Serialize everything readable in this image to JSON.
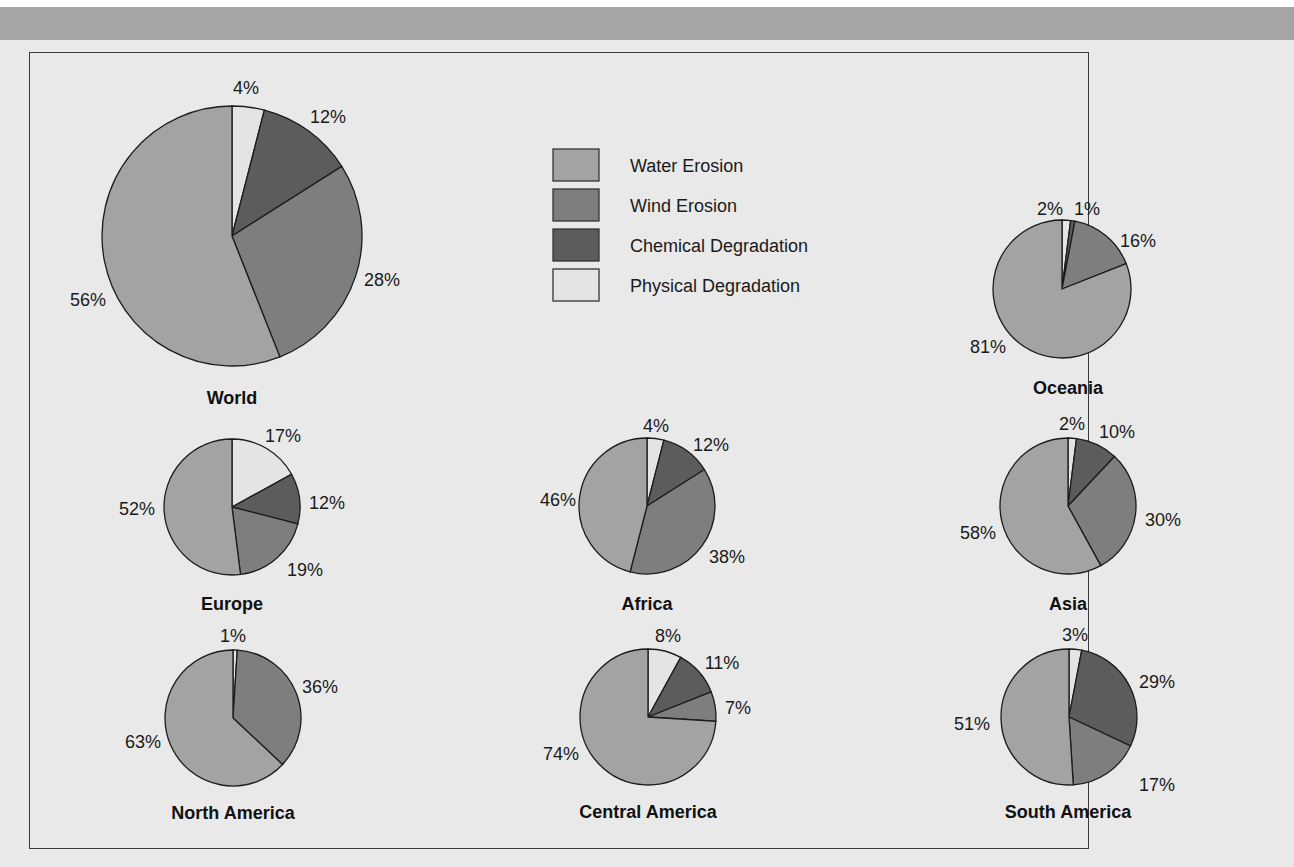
{
  "chart_data": {
    "type": "pie",
    "title": "",
    "legend": {
      "position": "top-center",
      "entries": [
        {
          "label": "Water Erosion",
          "color": "#a3a3a3"
        },
        {
          "label": "Wind Erosion",
          "color": "#7e7e7e"
        },
        {
          "label": "Chemical Degradation",
          "color": "#5c5c5c"
        },
        {
          "label": "Physical Degradation",
          "color": "#e4e4e4"
        }
      ]
    },
    "categories": [
      "Water Erosion",
      "Wind Erosion",
      "Chemical Degradation",
      "Physical Degradation"
    ],
    "charts": [
      {
        "name": "World",
        "values": {
          "Water Erosion": 56,
          "Wind Erosion": 28,
          "Chemical Degradation": 12,
          "Physical Degradation": 4
        }
      },
      {
        "name": "Oceania",
        "values": {
          "Water Erosion": 81,
          "Wind Erosion": 16,
          "Chemical Degradation": 1,
          "Physical Degradation": 2
        }
      },
      {
        "name": "Europe",
        "values": {
          "Water Erosion": 52,
          "Wind Erosion": 19,
          "Chemical Degradation": 12,
          "Physical Degradation": 17
        }
      },
      {
        "name": "Africa",
        "values": {
          "Water Erosion": 46,
          "Wind Erosion": 38,
          "Chemical Degradation": 12,
          "Physical Degradation": 4
        }
      },
      {
        "name": "Asia",
        "values": {
          "Water Erosion": 58,
          "Wind Erosion": 30,
          "Chemical Degradation": 10,
          "Physical Degradation": 2
        }
      },
      {
        "name": "North America",
        "values": {
          "Water Erosion": 63,
          "Wind Erosion": 36,
          "Chemical Degradation": 0,
          "Physical Degradation": 1
        }
      },
      {
        "name": "Central America",
        "values": {
          "Water Erosion": 74,
          "Wind Erosion": 7,
          "Chemical Degradation": 11,
          "Physical Degradation": 8
        }
      },
      {
        "name": "South America",
        "values": {
          "Water Erosion": 51,
          "Wind Erosion": 17,
          "Chemical Degradation": 29,
          "Physical Degradation": 3
        }
      }
    ]
  },
  "layout": {
    "slice_order_clockwise_from_top": [
      "Physical Degradation",
      "Chemical Degradation",
      "Wind Erosion",
      "Water Erosion"
    ],
    "pies": [
      {
        "cx": 232,
        "cy": 236,
        "r": 130,
        "title_x": 232,
        "title_y": 404,
        "labels": [
          {
            "text": "4%",
            "x": 246,
            "y": 94
          },
          {
            "text": "12%",
            "x": 328,
            "y": 123
          },
          {
            "text": "28%",
            "x": 382,
            "y": 286
          },
          {
            "text": "56%",
            "x": 88,
            "y": 306
          }
        ]
      },
      {
        "cx": 1062,
        "cy": 289,
        "r": 69,
        "title_x": 1068,
        "title_y": 394,
        "labels": [
          {
            "text": "2%",
            "x": 1050,
            "y": 215
          },
          {
            "text": "1%",
            "x": 1087,
            "y": 215
          },
          {
            "text": "16%",
            "x": 1138,
            "y": 247
          },
          {
            "text": "81%",
            "x": 988,
            "y": 353
          }
        ]
      },
      {
        "cx": 232,
        "cy": 507,
        "r": 68,
        "title_x": 232,
        "title_y": 610,
        "labels": [
          {
            "text": "17%",
            "x": 283,
            "y": 442
          },
          {
            "text": "12%",
            "x": 327,
            "y": 509
          },
          {
            "text": "19%",
            "x": 305,
            "y": 576
          },
          {
            "text": "52%",
            "x": 137,
            "y": 515
          }
        ]
      },
      {
        "cx": 647,
        "cy": 506,
        "r": 68,
        "title_x": 647,
        "title_y": 610,
        "labels": [
          {
            "text": "4%",
            "x": 656,
            "y": 432
          },
          {
            "text": "12%",
            "x": 711,
            "y": 451
          },
          {
            "text": "38%",
            "x": 727,
            "y": 563
          },
          {
            "text": "46%",
            "x": 558,
            "y": 506
          }
        ]
      },
      {
        "cx": 1068,
        "cy": 506,
        "r": 68,
        "title_x": 1068,
        "title_y": 610,
        "labels": [
          {
            "text": "2%",
            "x": 1072,
            "y": 430
          },
          {
            "text": "10%",
            "x": 1117,
            "y": 438
          },
          {
            "text": "30%",
            "x": 1163,
            "y": 526
          },
          {
            "text": "58%",
            "x": 978,
            "y": 539
          }
        ]
      },
      {
        "cx": 233,
        "cy": 718,
        "r": 68,
        "title_x": 233,
        "title_y": 819,
        "labels": [
          {
            "text": "1%",
            "x": 233,
            "y": 642
          },
          {
            "text": "36%",
            "x": 320,
            "y": 693
          },
          {
            "text": "63%",
            "x": 143,
            "y": 748
          }
        ]
      },
      {
        "cx": 648,
        "cy": 717,
        "r": 68,
        "title_x": 648,
        "title_y": 818,
        "labels": [
          {
            "text": "8%",
            "x": 668,
            "y": 642
          },
          {
            "text": "11%",
            "x": 722,
            "y": 669
          },
          {
            "text": "7%",
            "x": 738,
            "y": 714
          },
          {
            "text": "74%",
            "x": 561,
            "y": 760
          }
        ]
      },
      {
        "cx": 1069,
        "cy": 717,
        "r": 68,
        "title_x": 1068,
        "title_y": 818,
        "labels": [
          {
            "text": "3%",
            "x": 1075,
            "y": 641
          },
          {
            "text": "29%",
            "x": 1157,
            "y": 688
          },
          {
            "text": "17%",
            "x": 1157,
            "y": 791
          },
          {
            "text": "51%",
            "x": 972,
            "y": 730
          }
        ]
      }
    ],
    "legend": {
      "x": 553,
      "y": 149,
      "swatch_w": 46,
      "swatch_h": 32,
      "row_gap": 40,
      "text_x": 630
    }
  }
}
